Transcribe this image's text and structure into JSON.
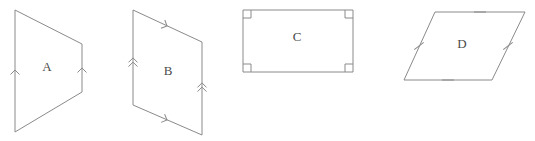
{
  "figure": {
    "background_color": "#ffffff",
    "stroke_color": "#8a8a8a",
    "label_color": "#4a4a4a",
    "width": 535,
    "height": 141
  },
  "shapes": [
    {
      "label": "A",
      "kind": "trapezoid",
      "label_x": 47,
      "label_y": 68,
      "points": "15,10 82,44 82,92 15,132",
      "marks": [
        {
          "name": "single-arrow-left-side",
          "type": "arrow",
          "count": 1,
          "x": 15,
          "y": 70,
          "angle": 0
        },
        {
          "name": "single-arrow-right-side",
          "type": "arrow",
          "count": 1,
          "x": 82,
          "y": 68,
          "angle": 0
        }
      ]
    },
    {
      "label": "B",
      "kind": "parallelogram",
      "label_x": 168,
      "label_y": 72,
      "points": "133,10 202,42 202,135 133,105",
      "marks": [
        {
          "name": "single-arrow-top-side",
          "type": "arrow",
          "count": 1,
          "x": 167,
          "y": 26,
          "angle": 115
        },
        {
          "name": "single-arrow-bottom-side",
          "type": "arrow",
          "count": 1,
          "x": 167,
          "y": 120,
          "angle": 113
        },
        {
          "name": "double-arrow-left-side",
          "type": "arrow",
          "count": 2,
          "x": 133,
          "y": 60,
          "angle": 0
        },
        {
          "name": "double-arrow-right-side",
          "type": "arrow",
          "count": 2,
          "x": 202,
          "y": 85,
          "angle": 0
        }
      ]
    },
    {
      "label": "C",
      "kind": "rectangle",
      "label_x": 297,
      "label_y": 38,
      "points": "243,10 353,10 353,72 243,72",
      "marks": [
        {
          "name": "right-angle-corner-top-left",
          "type": "right-angle",
          "x": 243,
          "y": 10,
          "dx": 1,
          "dy": 1
        },
        {
          "name": "right-angle-corner-top-right",
          "type": "right-angle",
          "x": 353,
          "y": 10,
          "dx": -1,
          "dy": 1
        },
        {
          "name": "right-angle-corner-bottom-right",
          "type": "right-angle",
          "x": 353,
          "y": 72,
          "dx": -1,
          "dy": -1
        },
        {
          "name": "right-angle-corner-bottom-left",
          "type": "right-angle",
          "x": 243,
          "y": 72,
          "dx": 1,
          "dy": -1
        }
      ]
    },
    {
      "label": "D",
      "kind": "rhombus",
      "label_x": 462,
      "label_y": 45,
      "points": "435,12 525,12 492,80 404,80",
      "marks": [
        {
          "name": "tick-top-side",
          "type": "tick",
          "count": 1,
          "x": 480,
          "y": 12,
          "angle": 90
        },
        {
          "name": "tick-bottom-side",
          "type": "tick",
          "count": 1,
          "x": 448,
          "y": 80,
          "angle": 90
        },
        {
          "name": "tick-left-side",
          "type": "tick",
          "count": 1,
          "x": 419,
          "y": 46,
          "angle": 52
        },
        {
          "name": "tick-right-side",
          "type": "tick",
          "count": 1,
          "x": 508,
          "y": 46,
          "angle": 52
        }
      ]
    }
  ]
}
